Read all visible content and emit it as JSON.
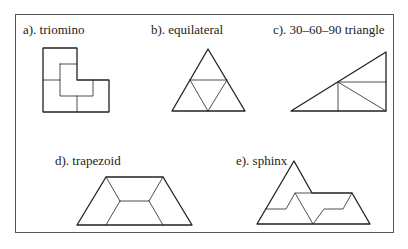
{
  "figures": [
    {
      "id": "a",
      "label": "a). triomino"
    },
    {
      "id": "b",
      "label": "b). equilateral"
    },
    {
      "id": "c",
      "label": "c). 30–60–90 triangle"
    },
    {
      "id": "d",
      "label": "d). trapezoid"
    },
    {
      "id": "e",
      "label": "e). sphinx"
    }
  ],
  "colors": {
    "stroke": "#222222",
    "border": "#555555",
    "background": "#ffffff"
  }
}
